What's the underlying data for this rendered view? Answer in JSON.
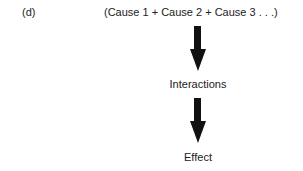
{
  "diagram": {
    "panel_label": "(d)",
    "causes": "(Cause 1 + Cause 2 + Cause 3 . . .)",
    "middle": "Interactions",
    "result": "Effect",
    "arrow_color": "#111111"
  }
}
